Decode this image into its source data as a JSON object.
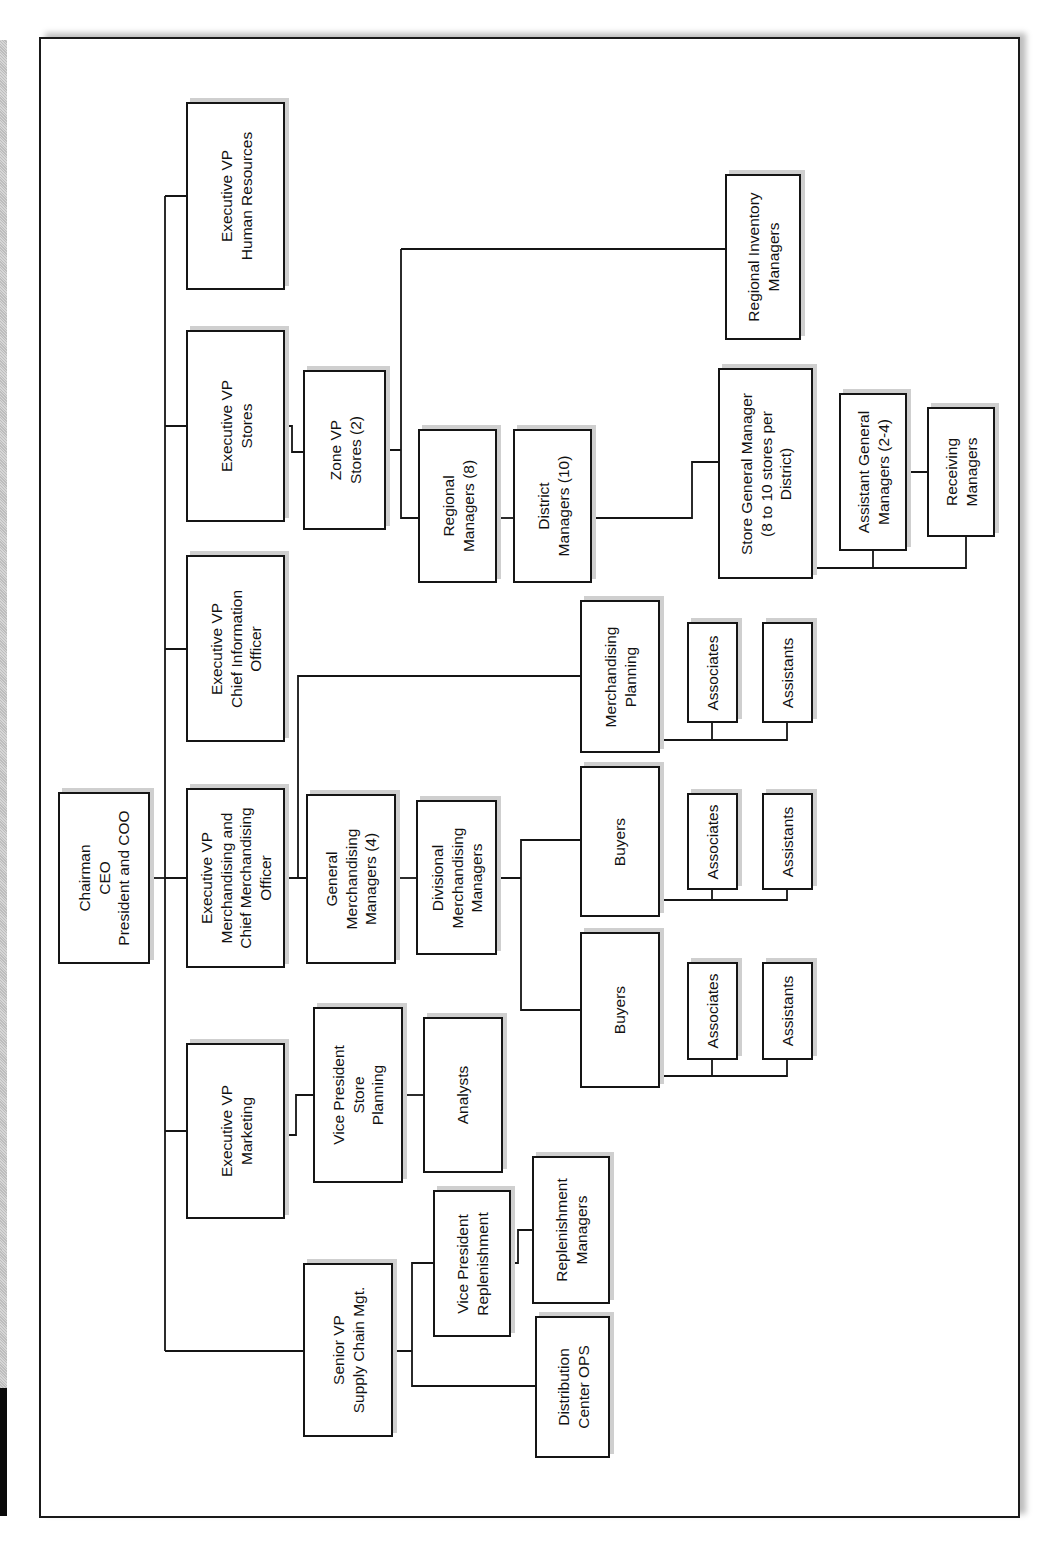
{
  "diagram": {
    "type": "organization-chart",
    "orientation": "rotated-90-ccw",
    "nodes": [
      {
        "id": "ceo",
        "label": "Chairman\nCEO\nPresident and COO",
        "x": 58,
        "y": 792,
        "w": 92,
        "h": 172
      },
      {
        "id": "evp_hr",
        "label": "Executive VP\nHuman Resources",
        "x": 186,
        "y": 102,
        "w": 99,
        "h": 188
      },
      {
        "id": "evp_stores",
        "label": "Executive VP\nStores",
        "x": 186,
        "y": 330,
        "w": 99,
        "h": 192
      },
      {
        "id": "evp_cio",
        "label": "Executive VP\nChief Information\nOfficer",
        "x": 186,
        "y": 555,
        "w": 99,
        "h": 187
      },
      {
        "id": "evp_merch",
        "label": "Executive VP\nMerchandising and\nChief Merchandising\nOfficer",
        "x": 186,
        "y": 788,
        "w": 99,
        "h": 180
      },
      {
        "id": "evp_mkt",
        "label": "Executive VP\nMarketing",
        "x": 186,
        "y": 1043,
        "w": 99,
        "h": 176
      },
      {
        "id": "svp_supply",
        "label": "Senior VP\nSupply Chain Mgt.",
        "x": 303,
        "y": 1263,
        "w": 90,
        "h": 174
      },
      {
        "id": "zone_vp",
        "label": "Zone VP\nStores (2)",
        "x": 303,
        "y": 370,
        "w": 83,
        "h": 160
      },
      {
        "id": "regional_mgrs",
        "label": "Regional\nManagers (8)",
        "x": 418,
        "y": 429,
        "w": 79,
        "h": 154
      },
      {
        "id": "district_mgrs",
        "label": "District\nManagers (10)",
        "x": 513,
        "y": 429,
        "w": 79,
        "h": 154
      },
      {
        "id": "regional_inv",
        "label": "Regional Inventory\nManagers",
        "x": 725,
        "y": 174,
        "w": 76,
        "h": 166
      },
      {
        "id": "store_gm",
        "label": "Store General Manager\n(8 to 10 stores per\nDistrict)",
        "x": 718,
        "y": 368,
        "w": 95,
        "h": 211
      },
      {
        "id": "asst_gm",
        "label": "Assistant General\nManagers (2-4)",
        "x": 839,
        "y": 393,
        "w": 68,
        "h": 158
      },
      {
        "id": "receiving_mgrs",
        "label": "Receiving\nManagers",
        "x": 927,
        "y": 407,
        "w": 68,
        "h": 130
      },
      {
        "id": "merch_planning",
        "label": "Merchandising\nPlanning",
        "x": 580,
        "y": 600,
        "w": 80,
        "h": 153
      },
      {
        "id": "mp_associates",
        "label": "Associates",
        "x": 687,
        "y": 622,
        "w": 51,
        "h": 101
      },
      {
        "id": "mp_assistants",
        "label": "Assistants",
        "x": 762,
        "y": 622,
        "w": 51,
        "h": 101
      },
      {
        "id": "gmm",
        "label": "General\nMerchandising\nManagers (4)",
        "x": 306,
        "y": 794,
        "w": 90,
        "h": 170
      },
      {
        "id": "dmm",
        "label": "Divisional\nMerchandising\nManagers",
        "x": 416,
        "y": 800,
        "w": 81,
        "h": 155
      },
      {
        "id": "buyers_1",
        "label": "Buyers",
        "x": 580,
        "y": 766,
        "w": 80,
        "h": 151
      },
      {
        "id": "b1_associates",
        "label": "Associates",
        "x": 687,
        "y": 793,
        "w": 51,
        "h": 97
      },
      {
        "id": "b1_assistants",
        "label": "Assistants",
        "x": 762,
        "y": 793,
        "w": 51,
        "h": 97
      },
      {
        "id": "buyers_2",
        "label": "Buyers",
        "x": 580,
        "y": 932,
        "w": 80,
        "h": 156
      },
      {
        "id": "b2_associates",
        "label": "Associates",
        "x": 687,
        "y": 962,
        "w": 51,
        "h": 98
      },
      {
        "id": "b2_assistants",
        "label": "Assistants",
        "x": 762,
        "y": 962,
        "w": 51,
        "h": 98
      },
      {
        "id": "vp_store_planning",
        "label": "Vice President\nStore\nPlanning",
        "x": 313,
        "y": 1007,
        "w": 90,
        "h": 176
      },
      {
        "id": "analysts",
        "label": "Analysts",
        "x": 423,
        "y": 1017,
        "w": 80,
        "h": 156
      },
      {
        "id": "vp_replenishment",
        "label": "Vice President\nReplenishment",
        "x": 433,
        "y": 1190,
        "w": 78,
        "h": 147
      },
      {
        "id": "replenishment_mgrs",
        "label": "Replenishment\nManagers",
        "x": 532,
        "y": 1156,
        "w": 78,
        "h": 148
      },
      {
        "id": "dc_ops",
        "label": "Distribution\nCenter OPS",
        "x": 535,
        "y": 1316,
        "w": 75,
        "h": 142
      }
    ],
    "edges": [
      {
        "from": "ceo",
        "to": [
          "evp_hr",
          "evp_stores",
          "evp_cio",
          "evp_merch",
          "evp_mkt",
          "svp_supply"
        ]
      },
      {
        "from": "evp_stores",
        "to": [
          "zone_vp"
        ]
      },
      {
        "from": "zone_vp",
        "to": [
          "regional_mgrs",
          "regional_inv"
        ]
      },
      {
        "from": "regional_mgrs",
        "to": [
          "district_mgrs"
        ]
      },
      {
        "from": "district_mgrs",
        "to": [
          "store_gm"
        ]
      },
      {
        "from": "store_gm",
        "to": [
          "asst_gm",
          "receiving_mgrs"
        ]
      },
      {
        "from": "asst_gm",
        "to": [
          "receiving_mgrs"
        ]
      },
      {
        "from": "evp_merch",
        "to": [
          "gmm",
          "merch_planning"
        ]
      },
      {
        "from": "merch_planning",
        "to": [
          "mp_associates",
          "mp_assistants"
        ]
      },
      {
        "from": "gmm",
        "to": [
          "dmm"
        ]
      },
      {
        "from": "dmm",
        "to": [
          "buyers_1",
          "buyers_2"
        ]
      },
      {
        "from": "buyers_1",
        "to": [
          "b1_associates",
          "b1_assistants"
        ]
      },
      {
        "from": "buyers_2",
        "to": [
          "b2_associates",
          "b2_assistants"
        ]
      },
      {
        "from": "evp_mkt",
        "to": [
          "vp_store_planning"
        ]
      },
      {
        "from": "vp_store_planning",
        "to": [
          "analysts"
        ]
      },
      {
        "from": "svp_supply",
        "to": [
          "vp_replenishment",
          "dc_ops"
        ]
      },
      {
        "from": "vp_replenishment",
        "to": [
          "replenishment_mgrs"
        ]
      }
    ]
  },
  "colors": {
    "line": "#151515",
    "shadow": "#cfcfcf",
    "background": "#ffffff"
  }
}
